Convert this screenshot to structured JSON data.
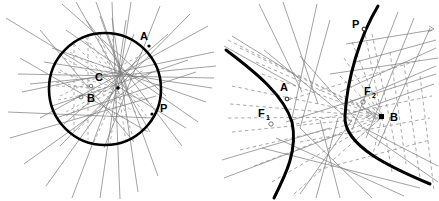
{
  "figure": {
    "background_color": "#ffffff",
    "width": 439,
    "height": 201,
    "stroke_colors": {
      "curve": "#000000",
      "solid_line": "#7a7a7a",
      "dashed_line": "#8c8c8c",
      "label": "#000000"
    }
  },
  "panels": [
    {
      "id": "left-panel",
      "name": "circle-construction",
      "conic_type": "circle",
      "center": {
        "x": 105,
        "y": 89
      },
      "radius": 56,
      "labels": [
        {
          "text": "A",
          "x": 140,
          "y": 40,
          "point": {
            "x": 149,
            "y": 46
          }
        },
        {
          "text": "C",
          "x": 95,
          "y": 81,
          "point": {
            "x": 91,
            "y": 86
          }
        },
        {
          "text": "B",
          "x": 87,
          "y": 102,
          "point": {
            "x": 81,
            "y": 97
          }
        },
        {
          "text": "P",
          "x": 160,
          "y": 112,
          "point": {
            "x": 152,
            "y": 114
          }
        }
      ],
      "pencil_point": {
        "x": 118,
        "y": 88
      }
    },
    {
      "id": "right-panel",
      "name": "hyperbola-construction",
      "conic_type": "hyperbola",
      "labels": [
        {
          "text": "P",
          "x": 352,
          "y": 28,
          "point": {
            "x": 364,
            "y": 29
          }
        },
        {
          "text": "A",
          "x": 280,
          "y": 91,
          "point": {
            "x": 287,
            "y": 99
          }
        },
        {
          "text": "F",
          "subscript": "1",
          "x": 258,
          "y": 117,
          "point": {
            "x": 271,
            "y": 124
          }
        },
        {
          "text": "F",
          "subscript": "2",
          "x": 364,
          "y": 95,
          "point": {
            "x": 363,
            "y": 102
          }
        },
        {
          "text": "B",
          "x": 392,
          "y": 119,
          "point": {
            "x": 382,
            "y": 117
          }
        }
      ],
      "branches": [
        {
          "name": "left-branch",
          "vertex": {
            "x": 293,
            "y": 122
          }
        },
        {
          "name": "right-branch",
          "vertex": {
            "x": 344,
            "y": 115
          }
        }
      ]
    }
  ]
}
